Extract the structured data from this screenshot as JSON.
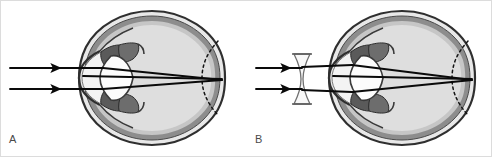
{
  "figure": {
    "width": 492,
    "height": 157,
    "background": "#ffffff",
    "panels": [
      {
        "id": "A",
        "label": "A",
        "caption_text": "A",
        "description": "Uncorrected myopic (elongated) eye: parallel light rays converge to a focal point in front of the retina",
        "has_corrective_lens": false,
        "ray_count": 2,
        "eye": {
          "name": "eye-cross-section-a",
          "center_x": 152,
          "center_y": 78,
          "radius_x": 72,
          "radius_y": 67
        }
      },
      {
        "id": "B",
        "label": "B",
        "caption_text": "B",
        "description": "Myopic eye corrected with a biconcave diverging spectacle lens; rays diverge before entering the eye and focus on the retina",
        "has_corrective_lens": true,
        "corrective_lens_type": "biconcave-diverging",
        "ray_count": 2,
        "eye": {
          "name": "eye-cross-section-b",
          "center_x": 402,
          "center_y": 78,
          "radius_x": 72,
          "radius_y": 67
        }
      }
    ],
    "anatomy_parts": [
      {
        "key": "sclera",
        "label": "Sclera",
        "color": "#3a3a3a"
      },
      {
        "key": "choroid",
        "label": "Choroid",
        "color": "#8c8c8c"
      },
      {
        "key": "retina",
        "label": "Retina",
        "color": "#bdbdbd"
      },
      {
        "key": "vitreous-body",
        "label": "Vitreous body",
        "color": "#dcdcdc"
      },
      {
        "key": "cornea",
        "label": "Cornea",
        "color": "#efefef"
      },
      {
        "key": "anterior-chamber",
        "label": "Anterior chamber",
        "color": "#f4f4f4"
      },
      {
        "key": "lens",
        "label": "Crystalline lens",
        "color": "#fbfbfb"
      },
      {
        "key": "iris",
        "label": "Iris",
        "color": "#606060"
      },
      {
        "key": "ciliary-body",
        "label": "Ciliary body",
        "color": "#6e6e6e"
      },
      {
        "key": "normal-eye-outline",
        "label": "Normal (emmetropic) eyeball outline",
        "color": "#1a1a1a",
        "style": "dashed"
      },
      {
        "key": "light-ray",
        "label": "Incident light ray",
        "color": "#0d0d0d"
      },
      {
        "key": "spectacle-lens",
        "label": "Concave corrective lens",
        "color": "#f7f7f7"
      }
    ],
    "colors": {
      "sclera_dark": "#3a3a3a",
      "choroid_gray": "#8f8f8f",
      "vitreous_fill": "#dcdcdc",
      "lens_fill": "#fdfdfd",
      "iris_dark": "#555555",
      "ray_stroke": "#0a0a0a",
      "dashed_retina": "#151515",
      "label_text": "#4a4a4a",
      "frame_border": "#d8d8d8",
      "background": "#ffffff"
    }
  }
}
